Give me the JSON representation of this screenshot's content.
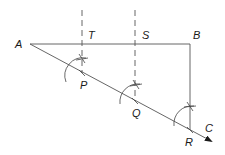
{
  "diagram": {
    "type": "geometric construction",
    "labels": {
      "A": "A",
      "B": "B",
      "C": "C",
      "T": "T",
      "S": "S",
      "P": "P",
      "Q": "Q",
      "R": "R"
    },
    "points": {
      "A": [
        30,
        44
      ],
      "B": [
        190,
        44
      ],
      "T": [
        82,
        44
      ],
      "S": [
        135,
        44
      ],
      "P": [
        82,
        73
      ],
      "Q": [
        135,
        101
      ],
      "R": [
        190,
        130
      ],
      "C": [
        212,
        142
      ]
    },
    "colors": {
      "line": "#555555",
      "text": "#1a1a1a",
      "background": "#ffffff"
    }
  }
}
